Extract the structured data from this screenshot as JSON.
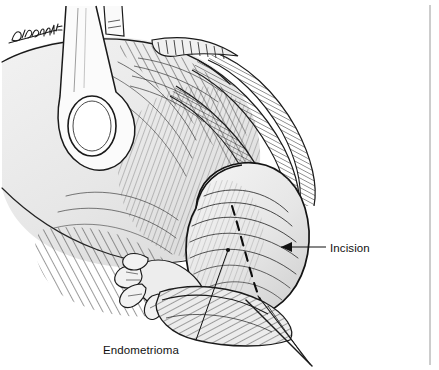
{
  "figure": {
    "kind": "medical-illustration",
    "style": "pen-and-ink line drawing with hatching",
    "width": 439,
    "height": 370,
    "background_color": "#ffffff",
    "ink_color": "#1a1a1a",
    "tissue_fill_color": "#e9e9e9",
    "tissue_fill_shadow": "#d2d2d2"
  },
  "labels": [
    {
      "id": "incision",
      "text": "Incision",
      "x": 330,
      "y": 242,
      "leader": "horizontal line with arrowhead pointing left to the dashed cut line"
    },
    {
      "id": "endometrioma",
      "text": "Endometrioma",
      "x": 103,
      "y": 344,
      "leader": "diagonal line running up-right to the ovarian cyst body"
    }
  ],
  "annotations": {
    "incision_line": {
      "name": "dashed-incision-line",
      "style": "dashed",
      "description": "Dashed line marking the planned cortical incision over the endometrioma"
    },
    "signature": {
      "name": "artist-signature",
      "text": "D.Ahdoot",
      "rendered_as": "handwritten script in upper left",
      "x": 10,
      "y": 30
    }
  },
  "anatomy": [
    {
      "name": "uterus-body",
      "note": "large pale mass occupying left and center"
    },
    {
      "name": "surgical-retractor-hook",
      "note": "instrument loop at upper left holding tissue"
    },
    {
      "name": "fallopian-tube",
      "note": "cross-hatched tubular structure sweeping from upper right down to the ovary"
    },
    {
      "name": "fimbriae",
      "note": "finger-like projections at the lower left of the ovary"
    },
    {
      "name": "ovary-endometrioma",
      "note": "rounded cyst mass at lower right bearing the incision line"
    },
    {
      "name": "suture-strands",
      "note": "two fine crossing threads trailing to lower right"
    }
  ],
  "frame": {
    "right_rule": {
      "name": "right-vertical-rule",
      "x": 430,
      "y_start": 5,
      "y_end": 365,
      "color": "#999999"
    }
  }
}
